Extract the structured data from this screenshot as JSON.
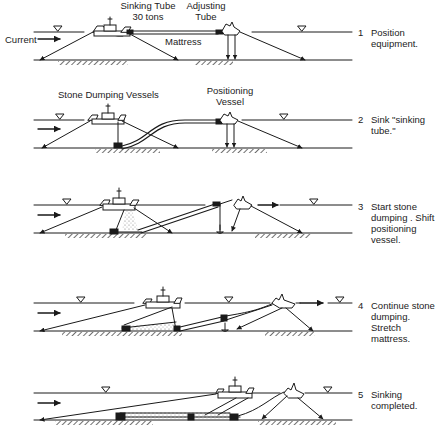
{
  "figure": {
    "colors": {
      "ink": "#1a1a1a",
      "background": "#ffffff",
      "stone": "#9a9a9a"
    }
  },
  "labels": {
    "current": "Current",
    "sinking_tube": "Sinking Tube",
    "sinking_tube_weight": "30 tons",
    "adjusting_tube_1": "Adjusting",
    "adjusting_tube_2": "Tube",
    "mattress": "Mattress",
    "stone_dumping_vessels": "Stone Dumping Vessels",
    "positioning_vessel_1": "Positioning",
    "positioning_vessel_2": "Vessel"
  },
  "steps": [
    {
      "number": "1",
      "text": "Position equipment.",
      "water_y": 32,
      "bed_y": 60
    },
    {
      "number": "2",
      "text": "Sink \"sinking tube.\"",
      "water_y": 120,
      "bed_y": 148
    },
    {
      "number": "3",
      "text": "Start stone dumping . Shift positioning vessel.",
      "water_y": 205,
      "bed_y": 233
    },
    {
      "number": "4",
      "text": "Continue stone dumping. Stretch mattress.",
      "water_y": 303,
      "bed_y": 331
    },
    {
      "number": "5",
      "text": "Sinking completed.",
      "water_y": 393,
      "bed_y": 420
    }
  ],
  "icons": {
    "water_level": "inverted-triangle",
    "flow_arrow": "right-arrow",
    "anchor": "anchor",
    "vessel": "ship"
  }
}
